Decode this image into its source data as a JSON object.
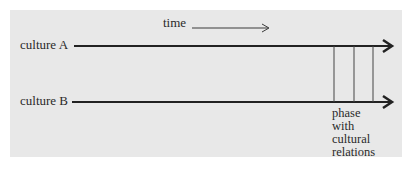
{
  "diagram": {
    "time_label": "time",
    "culture_a_label": "culture A",
    "culture_b_label": "culture B",
    "phase_label_lines": [
      "phase",
      "with",
      "cultural",
      "relations"
    ],
    "colors": {
      "background": "#e8e8e8",
      "ink": "#2a2a2a"
    },
    "lines": {
      "culture_a_y": 46,
      "culture_b_y": 102,
      "contact_x": [
        334,
        354,
        373
      ]
    }
  }
}
